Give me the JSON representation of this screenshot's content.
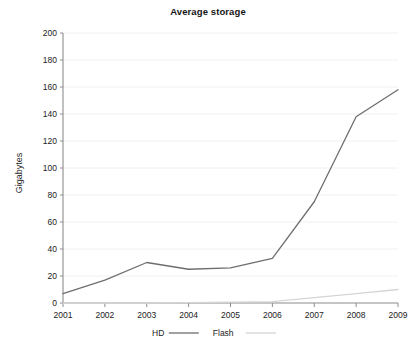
{
  "chart_data": {
    "type": "line",
    "title": "Average storage",
    "xlabel": "",
    "ylabel": "Gigabytes",
    "x": [
      2001,
      2002,
      2003,
      2004,
      2005,
      2006,
      2007,
      2008,
      2009
    ],
    "categories": [
      "2001",
      "2002",
      "2003",
      "2004",
      "2005",
      "2006",
      "2007",
      "2008",
      "2009"
    ],
    "xlim": [
      2001,
      2009
    ],
    "ylim": [
      0,
      200
    ],
    "ytick_values": [
      0,
      20,
      40,
      60,
      80,
      100,
      120,
      140,
      160,
      180,
      200
    ],
    "ytick_labels": [
      "0",
      "20",
      "40",
      "60",
      "80",
      "100",
      "120",
      "140",
      "160",
      "180",
      "200"
    ],
    "grid": "horizontal",
    "legend_position": "bottom",
    "series": [
      {
        "name": "HD",
        "color": "#6e6e6e",
        "values": [
          7,
          17,
          30,
          25,
          26,
          33,
          75,
          138,
          158
        ]
      },
      {
        "name": "Flash",
        "color": "#d5d5d5",
        "values": [
          0,
          0,
          0,
          0.3,
          0.6,
          1,
          4,
          7,
          10
        ]
      }
    ]
  },
  "legend": {
    "items": [
      {
        "label": "HD",
        "color": "#6e6e6e"
      },
      {
        "label": "Flash",
        "color": "#d5d5d5"
      }
    ]
  },
  "colors": {
    "background": "#ffffff",
    "axis": "#8c8c8c",
    "grid": "#eef0f2",
    "text": "#1c1c1c",
    "hd": "#6e6e6e",
    "flash": "#d5d5d5"
  }
}
